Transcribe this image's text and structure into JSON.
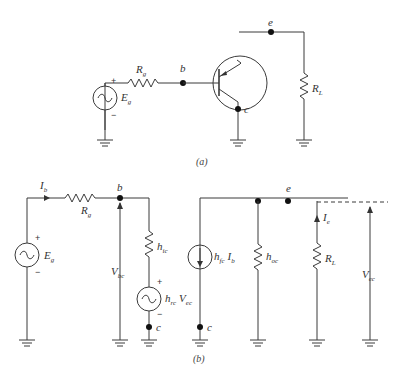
{
  "figure": {
    "part_a": {
      "caption": "(a)",
      "source": {
        "label": "E",
        "sub": "g",
        "plus": "+",
        "minus": "−"
      },
      "resistor_g": {
        "label": "R",
        "sub": "g"
      },
      "node_b": "b",
      "node_e": "e",
      "node_c": "c",
      "load": {
        "label": "R",
        "sub": "L"
      }
    },
    "part_b": {
      "caption": "(b)",
      "current_b": {
        "label": "I",
        "sub": "b"
      },
      "resistor_g": {
        "label": "R",
        "sub": "g"
      },
      "source": {
        "label": "E",
        "sub": "g",
        "plus": "+",
        "minus": "−"
      },
      "node_b": "b",
      "v_bc": {
        "label": "V",
        "sub": "bc"
      },
      "h_ic": {
        "label": "h",
        "sub": "ic"
      },
      "dep_voltage": {
        "label": "h",
        "sub": "rc",
        "label2": "V",
        "sub2": "ec",
        "plus": "+",
        "minus": "−"
      },
      "node_c1": "c",
      "dep_current": {
        "label": "h",
        "sub": "fc",
        "label2": "I",
        "sub2": "b"
      },
      "node_c2": "c",
      "h_oc": {
        "label": "h",
        "sub": "oc"
      },
      "node_e": "e",
      "current_e": {
        "label": "I",
        "sub": "e"
      },
      "load": {
        "label": "R",
        "sub": "L"
      },
      "v_ec": {
        "label": "V",
        "sub": "ec"
      }
    }
  }
}
